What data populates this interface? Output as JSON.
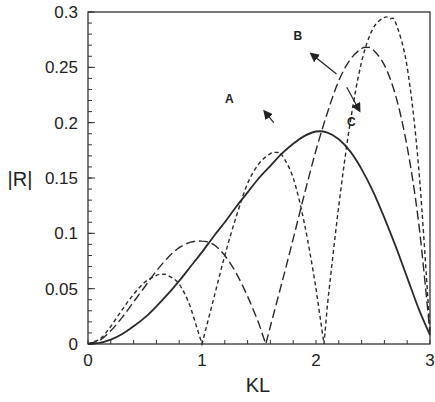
{
  "chart_data": {
    "type": "line",
    "title": "",
    "xlabel": "KL",
    "ylabel": "|R|",
    "xlim": [
      0,
      3
    ],
    "ylim": [
      0,
      0.3
    ],
    "xticks": [
      0,
      1,
      2,
      3
    ],
    "xtick_labels": [
      "0",
      "1",
      "2",
      "3"
    ],
    "yticks": [
      0,
      0.05,
      0.1,
      0.15,
      0.2,
      0.25,
      0.3
    ],
    "ytick_labels": [
      "0",
      "0.05",
      "0.1",
      "0.15",
      "0.2",
      "0.25",
      "0.3"
    ],
    "minor_x_step": 0.2,
    "minor_y_step": 0.01,
    "grid": false,
    "legend": null,
    "series": [
      {
        "name": "A",
        "style": "solid",
        "x": [
          0.0,
          0.1,
          0.2,
          0.3,
          0.4,
          0.5,
          0.6,
          0.7,
          0.8,
          0.9,
          1.0,
          1.1,
          1.2,
          1.3,
          1.4,
          1.5,
          1.6,
          1.7,
          1.8,
          1.9,
          2.0,
          2.1,
          2.2,
          2.3,
          2.4,
          2.5,
          2.6,
          2.7,
          2.8,
          2.9,
          3.0
        ],
        "y": [
          0.0,
          0.001,
          0.004,
          0.009,
          0.016,
          0.024,
          0.034,
          0.045,
          0.057,
          0.07,
          0.083,
          0.097,
          0.11,
          0.124,
          0.137,
          0.15,
          0.161,
          0.172,
          0.181,
          0.188,
          0.192,
          0.191,
          0.185,
          0.174,
          0.158,
          0.138,
          0.114,
          0.088,
          0.06,
          0.032,
          0.008
        ]
      },
      {
        "name": "B",
        "style": "long-dash",
        "x": [
          0.0,
          0.1,
          0.2,
          0.3,
          0.4,
          0.5,
          0.6,
          0.7,
          0.8,
          0.9,
          1.0,
          1.1,
          1.2,
          1.3,
          1.4,
          1.5,
          1.56,
          1.6,
          1.7,
          1.8,
          1.9,
          2.0,
          2.1,
          2.2,
          2.3,
          2.4,
          2.45,
          2.5,
          2.6,
          2.7,
          2.8,
          2.9,
          3.0
        ],
        "y": [
          0.0,
          0.003,
          0.012,
          0.024,
          0.038,
          0.052,
          0.066,
          0.078,
          0.087,
          0.092,
          0.093,
          0.09,
          0.08,
          0.064,
          0.043,
          0.018,
          0.0,
          0.016,
          0.055,
          0.095,
          0.136,
          0.175,
          0.209,
          0.238,
          0.257,
          0.267,
          0.268,
          0.266,
          0.252,
          0.224,
          0.178,
          0.11,
          0.01
        ]
      },
      {
        "name": "C",
        "style": "short-dash",
        "x": [
          0.0,
          0.1,
          0.2,
          0.3,
          0.4,
          0.5,
          0.6,
          0.65,
          0.7,
          0.8,
          0.9,
          1.0,
          1.1,
          1.2,
          1.3,
          1.4,
          1.5,
          1.6,
          1.66,
          1.7,
          1.8,
          1.9,
          2.0,
          2.07,
          2.1,
          2.2,
          2.3,
          2.4,
          2.5,
          2.6,
          2.65,
          2.7,
          2.8,
          2.9,
          3.0
        ],
        "y": [
          0.0,
          0.004,
          0.016,
          0.031,
          0.045,
          0.056,
          0.062,
          0.063,
          0.062,
          0.054,
          0.033,
          0.0,
          0.04,
          0.08,
          0.115,
          0.145,
          0.163,
          0.172,
          0.173,
          0.171,
          0.15,
          0.108,
          0.05,
          0.0,
          0.035,
          0.125,
          0.2,
          0.255,
          0.285,
          0.295,
          0.294,
          0.29,
          0.25,
          0.16,
          0.012
        ]
      }
    ],
    "annotations": [
      {
        "text": "A",
        "label_x": 1.24,
        "label_y": 0.218,
        "arrow_from": [
          1.63,
          0.2
        ],
        "arrow_to": [
          1.55,
          0.21
        ]
      },
      {
        "text": "B",
        "label_x": 1.84,
        "label_y": 0.275,
        "arrow_from": [
          2.18,
          0.244
        ],
        "arrow_to": [
          1.96,
          0.262
        ]
      },
      {
        "text": "C",
        "label_x": 2.31,
        "label_y": 0.197,
        "arrow_from": [
          2.27,
          0.232
        ],
        "arrow_to": [
          2.38,
          0.211
        ]
      }
    ]
  }
}
